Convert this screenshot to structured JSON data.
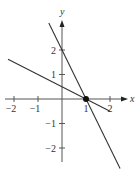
{
  "chart_data": {
    "type": "line",
    "title": "",
    "xlabel": "x",
    "ylabel": "y",
    "xlim": [
      -2.4,
      2.6
    ],
    "ylim": [
      -2.6,
      3.2
    ],
    "x_ticks": [
      -2,
      -1,
      1,
      2
    ],
    "x_tick_labels": [
      "−2",
      "−1",
      "1",
      "2"
    ],
    "y_ticks": [
      -2,
      -1,
      1,
      2
    ],
    "y_tick_labels": [
      "−2",
      "−1",
      "1",
      "2"
    ],
    "grid": false,
    "series": [
      {
        "name": "steep line",
        "equation": "y = -2x + 2",
        "x": [
          -0.55,
          2.42
        ],
        "y": [
          3.1,
          -2.84
        ]
      },
      {
        "name": "shallow line",
        "equation": "y = -0.5x + 0.5",
        "x": [
          -2.25,
          2.0
        ],
        "y": [
          1.625,
          -0.5
        ]
      }
    ],
    "points": [
      {
        "name": "intersection",
        "x": 1,
        "y": 0
      }
    ],
    "colors": {
      "line": "#333333",
      "axis": "#555555"
    }
  }
}
